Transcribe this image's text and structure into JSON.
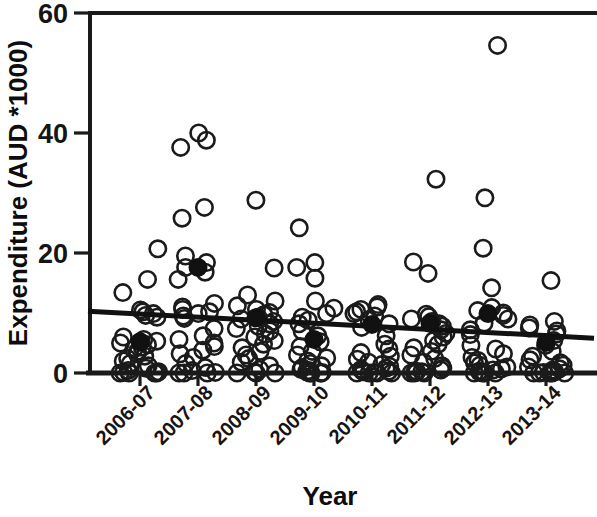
{
  "chart_data": {
    "type": "scatter",
    "title": "",
    "xlabel": "Year",
    "ylabel": "Expenditure (AUD *1000)",
    "grid": false,
    "legend": "none",
    "ylim": [
      0,
      60
    ],
    "y_ticks": [
      0,
      20,
      40,
      60
    ],
    "y_tick_labels": [
      "0",
      "20",
      "40",
      "60"
    ],
    "categories": [
      "2006-07",
      "2007-08",
      "2008-09",
      "2009-10",
      "2010-11",
      "2011-12",
      "2012-13",
      "2013-14"
    ],
    "x_tick_labels": [
      "2006-07",
      "2007-08",
      "2008-09",
      "2009-10",
      "2010-11",
      "2011-12",
      "2012-13",
      "2013-14"
    ],
    "series": [
      {
        "name": "Individual observations",
        "marker": "open-circle",
        "groups": [
          {
            "category": "2006-07",
            "values": [
              20.7,
              15.6,
              13.4,
              10.5,
              10.2,
              9.9,
              9.6,
              9.3,
              6.0,
              5.6,
              5.3,
              5.0,
              4.7,
              4.3,
              4.0,
              3.6,
              3.2,
              2.8,
              2.4,
              2.0,
              1.6,
              1.2,
              0.8,
              0.4,
              0.2,
              0.1,
              0.0,
              0.0,
              0.0,
              0.0
            ]
          },
          {
            "category": "2007-08",
            "values": [
              40.0,
              38.8,
              37.6,
              27.6,
              25.8,
              19.5,
              18.4,
              17.6,
              16.8,
              15.6,
              11.6,
              11.0,
              10.6,
              10.2,
              9.9,
              9.5,
              9.1,
              7.4,
              6.2,
              5.6,
              5.0,
              4.4,
              3.8,
              3.2,
              2.6,
              1.6,
              0.9,
              0.4,
              0.1,
              0.0,
              0.0,
              0.0
            ]
          },
          {
            "category": "2008-09",
            "values": [
              28.8,
              17.5,
              13.0,
              12.0,
              11.2,
              10.6,
              10.1,
              9.7,
              9.3,
              9.0,
              8.6,
              8.2,
              7.8,
              7.4,
              7.0,
              6.5,
              6.0,
              5.4,
              4.8,
              4.2,
              3.6,
              3.0,
              2.4,
              1.8,
              1.2,
              0.6,
              0.2,
              0.0,
              0.0,
              0.0
            ]
          },
          {
            "category": "2009-10",
            "values": [
              24.2,
              18.4,
              17.6,
              15.8,
              12.0,
              10.8,
              9.9,
              9.3,
              8.8,
              8.2,
              7.0,
              6.2,
              5.2,
              4.4,
              3.6,
              3.0,
              2.5,
              2.0,
              1.6,
              1.2,
              0.9,
              0.6,
              0.4,
              0.2,
              0.1,
              0.0,
              0.0,
              0.0,
              0.0
            ]
          },
          {
            "category": "2010-11",
            "values": [
              11.4,
              11.0,
              10.6,
              10.2,
              9.9,
              9.5,
              8.9,
              8.2,
              7.6,
              6.2,
              4.8,
              4.0,
              3.4,
              2.8,
              2.3,
              1.8,
              1.4,
              1.1,
              0.8,
              0.6,
              0.4,
              0.3,
              0.2,
              0.1,
              0.0,
              0.0,
              0.0,
              0.0
            ]
          },
          {
            "category": "2011-12",
            "values": [
              32.3,
              18.5,
              16.6,
              9.8,
              9.4,
              9.0,
              8.6,
              8.2,
              7.8,
              7.2,
              6.6,
              6.0,
              5.4,
              4.8,
              4.2,
              3.6,
              3.0,
              2.4,
              1.8,
              1.2,
              0.8,
              0.5,
              0.3,
              0.2,
              0.1,
              0.0,
              0.0,
              0.0
            ]
          },
          {
            "category": "2012-13",
            "values": [
              54.6,
              29.2,
              20.8,
              14.2,
              10.9,
              10.4,
              10.0,
              9.6,
              9.0,
              8.3,
              7.2,
              6.4,
              4.6,
              4.0,
              3.2,
              2.6,
              2.1,
              1.7,
              1.3,
              1.0,
              0.7,
              0.5,
              0.3,
              0.2,
              0.1,
              0.0,
              0.0,
              0.0,
              0.0
            ]
          },
          {
            "category": "2013-14",
            "values": [
              15.4,
              8.6,
              8.0,
              7.5,
              7.0,
              6.5,
              5.4,
              4.6,
              3.6,
              2.8,
              2.2,
              1.7,
              1.3,
              1.0,
              0.7,
              0.5,
              0.3,
              0.2,
              0.1,
              0.0,
              0.0,
              0.0,
              0.0,
              0.0
            ]
          }
        ]
      },
      {
        "name": "Mean",
        "marker": "filled-circle",
        "categories": [
          "2006-07",
          "2007-08",
          "2008-09",
          "2009-10",
          "2010-11",
          "2011-12",
          "2012-13",
          "2013-14"
        ],
        "values": [
          5.2,
          17.6,
          9.2,
          5.6,
          8.1,
          8.3,
          9.9,
          5.1
        ]
      }
    ],
    "trend_line": {
      "name": "Linear trend",
      "x_start_category": "2006-07",
      "x_end_category": "2013-14",
      "y_start": 10.3,
      "y_end": 5.8
    },
    "colors": {
      "axis": "#1a1a1a",
      "marker_open_stroke": "#1b1b1b",
      "marker_mean_fill": "#111111",
      "trend_line": "#111111",
      "background": "#ffffff"
    }
  }
}
